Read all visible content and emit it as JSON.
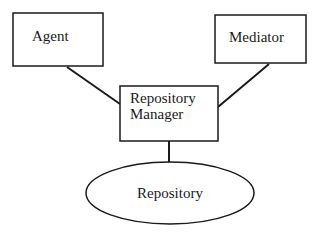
{
  "diagram": {
    "type": "architecture",
    "nodes": [
      {
        "id": "agent",
        "label": "Agent",
        "shape": "rectangle"
      },
      {
        "id": "mediator",
        "label": "Mediator",
        "shape": "rectangle"
      },
      {
        "id": "repository_manager",
        "label_line1": "Repository",
        "label_line2": "Manager",
        "shape": "rectangle"
      },
      {
        "id": "repository",
        "label": "Repository",
        "shape": "ellipse"
      }
    ],
    "edges": [
      {
        "from": "agent",
        "to": "repository_manager"
      },
      {
        "from": "mediator",
        "to": "repository_manager"
      },
      {
        "from": "repository_manager",
        "to": "repository"
      }
    ]
  },
  "colors": {
    "stroke": "#1a1a1a",
    "background": "#ffffff"
  }
}
